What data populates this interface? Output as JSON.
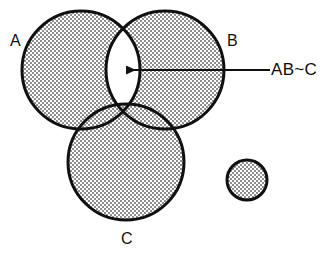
{
  "figure": {
    "type": "venn-diagram",
    "background_color": "#ffffff",
    "stroke_color": "#101010",
    "fill_pattern": "stipple-dots",
    "fill_color": "#d6d6d6",
    "empty_region_color": "#ffffff",
    "width": 336,
    "height": 253
  },
  "sets": [
    {
      "id": "A",
      "label": "A",
      "cx": 81,
      "cy": 70,
      "r": 59,
      "shaded": true
    },
    {
      "id": "B",
      "label": "B",
      "cx": 165,
      "cy": 70,
      "r": 59,
      "shaded": true
    },
    {
      "id": "C",
      "label": "C",
      "cx": 126,
      "cy": 162,
      "r": 58,
      "shaded": true
    },
    {
      "id": "D",
      "label": "",
      "cx": 247,
      "cy": 180,
      "r": 20,
      "shaded": true
    }
  ],
  "annotation": {
    "label": "AB~C",
    "arrow": {
      "tip_x": 124,
      "tip_y": 70,
      "tail_x": 270,
      "tail_y": 70,
      "direction": "left"
    },
    "target_region": "intersection of A and B excluding C"
  },
  "labels": {
    "a": "A",
    "b": "B",
    "c": "C",
    "annotation": "AB~C"
  }
}
